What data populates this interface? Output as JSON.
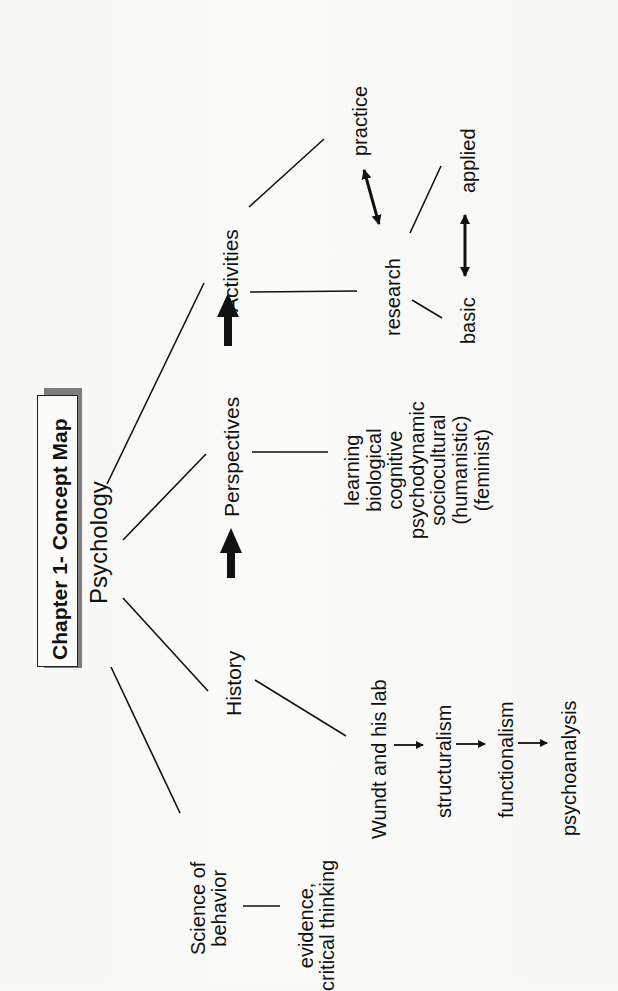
{
  "title": "Chapter 1- Concept Map",
  "root": "Psychology",
  "nodes": {
    "activities": "Activities",
    "perspectives": "Perspectives",
    "history": "History",
    "science": "Science of\nbehavior",
    "evidence": "evidence,\ncritical thinking",
    "practice": "practice",
    "research": "research",
    "applied": "applied",
    "basic": "basic",
    "perspective_list": "learning\nbiological\ncognitive\npsychodynamic\nsociocultural\n(humanistic)\n(feminist)",
    "wundt": "Wundt and his lab",
    "structuralism": "structuralism",
    "functionalism": "functionalism",
    "psychoanalysis": "psychoanalysis"
  },
  "edges": [
    {
      "from": "Psychology",
      "to": "Activities",
      "type": "line"
    },
    {
      "from": "Psychology",
      "to": "Perspectives",
      "type": "line"
    },
    {
      "from": "Psychology",
      "to": "History",
      "type": "line"
    },
    {
      "from": "Psychology",
      "to": "Science of behavior",
      "type": "line"
    },
    {
      "from": "History",
      "to": "Perspectives",
      "type": "thick-arrow"
    },
    {
      "from": "Perspectives",
      "to": "Activities",
      "type": "thick-arrow"
    },
    {
      "from": "Activities",
      "to": "practice",
      "type": "line"
    },
    {
      "from": "Activities",
      "to": "research",
      "type": "line"
    },
    {
      "from": "practice",
      "to": "research",
      "type": "double-arrow"
    },
    {
      "from": "research",
      "to": "applied",
      "type": "line"
    },
    {
      "from": "research",
      "to": "basic",
      "type": "line"
    },
    {
      "from": "basic",
      "to": "applied",
      "type": "double-arrow"
    },
    {
      "from": "Perspectives",
      "to": "perspective list",
      "type": "line"
    },
    {
      "from": "History",
      "to": "Wundt and his lab",
      "type": "line"
    },
    {
      "from": "Wundt and his lab",
      "to": "structuralism",
      "type": "arrow"
    },
    {
      "from": "structuralism",
      "to": "functionalism",
      "type": "arrow"
    },
    {
      "from": "functionalism",
      "to": "psychoanalysis",
      "type": "arrow"
    },
    {
      "from": "Science of behavior",
      "to": "evidence, critical thinking",
      "type": "line"
    }
  ],
  "colors": {
    "ink": "#111111",
    "shadow": "#7d7d7d",
    "paper": "#fafaf9"
  }
}
